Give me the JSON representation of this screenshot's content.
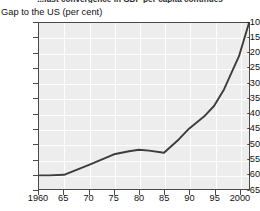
{
  "figure": {
    "supertitle": "...fast convergence in GDP per capita continues",
    "y_axis_caption": "Gap to the US (per cent)"
  },
  "chart_data": {
    "type": "line",
    "title": "...fast convergence in GDP per capita continues",
    "xlabel": "",
    "ylabel": "Gap to the US (per cent)",
    "xlim": [
      1960,
      2002
    ],
    "ylim": [
      -65,
      -10
    ],
    "grid": true,
    "legend": null,
    "x_tick_labels": [
      "1960",
      "65",
      "70",
      "75",
      "80",
      "85",
      "90",
      "95",
      "2000"
    ],
    "x_tick_values": [
      1960,
      1965,
      1970,
      1975,
      1980,
      1985,
      1990,
      1995,
      2000
    ],
    "y_tick_labels": [
      "-10",
      "-15",
      "-20",
      "-25",
      "-30",
      "-35",
      "-40",
      "-45",
      "-50",
      "-55",
      "-60",
      "-65"
    ],
    "y_tick_values": [
      -10,
      -15,
      -20,
      -25,
      -30,
      -35,
      -40,
      -45,
      -50,
      -55,
      -60,
      -65
    ],
    "line_color": "#3c3c3c",
    "plot_background": "#ededed",
    "gridline_color": "#fdfdfd",
    "series": [
      {
        "name": "Gap to the US (per cent)",
        "x": [
          1960,
          1962,
          1965,
          1970,
          1975,
          1978,
          1980,
          1982,
          1985,
          1988,
          1990,
          1993,
          1995,
          1997,
          2000,
          2002
        ],
        "values": [
          -60.5,
          -60.5,
          -60.3,
          -57.0,
          -53.5,
          -52.5,
          -52.0,
          -52.3,
          -53.0,
          -48.5,
          -45.0,
          -41.0,
          -37.5,
          -32.0,
          -21.0,
          -10.0
        ]
      }
    ]
  }
}
